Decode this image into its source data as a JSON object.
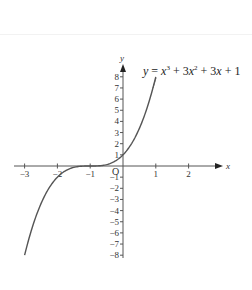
{
  "chart_data": {
    "type": "line",
    "title": "",
    "annotation": "y = x³ + 3x² + 3x + 1",
    "xlabel": "x",
    "ylabel": "y",
    "origin_label": "O",
    "xlim": [
      -3.2,
      3.1
    ],
    "ylim": [
      -8.5,
      9
    ],
    "grid": false,
    "x_ticks": [
      -3,
      -2,
      -1,
      1,
      2
    ],
    "x_tick_labels": [
      "−3",
      "−2",
      "−1",
      "1",
      "2"
    ],
    "y_ticks": [
      8,
      7,
      6,
      5,
      4,
      3,
      2,
      1,
      -1,
      -2,
      -3,
      -4,
      -5,
      -6,
      -7,
      -8
    ],
    "y_tick_labels": [
      "8",
      "7",
      "6",
      "5",
      "4",
      "3",
      "2",
      "1",
      "−1",
      "−2",
      "−3",
      "−4",
      "−5",
      "−6",
      "−7",
      "−8"
    ],
    "series": [
      {
        "name": "y = x³ + 3x² + 3x + 1",
        "x": [
          -3,
          -2.5,
          -2,
          -1.5,
          -1,
          -0.5,
          0,
          0.5,
          1
        ],
        "y": [
          -8,
          -3.375,
          -1,
          -0.125,
          0,
          0.125,
          1,
          3.375,
          8
        ]
      }
    ]
  },
  "labels": {
    "x_axis": "x",
    "y_axis": "y",
    "origin": "O",
    "eq_y": "y",
    "eq_eq": " = ",
    "eq_x1": "x",
    "eq_exp1": "3",
    "eq_plus1": " + 3",
    "eq_x2": "x",
    "eq_exp2": "2",
    "eq_plus2": " + 3",
    "eq_x3": "x",
    "eq_plus3": " + 1"
  }
}
